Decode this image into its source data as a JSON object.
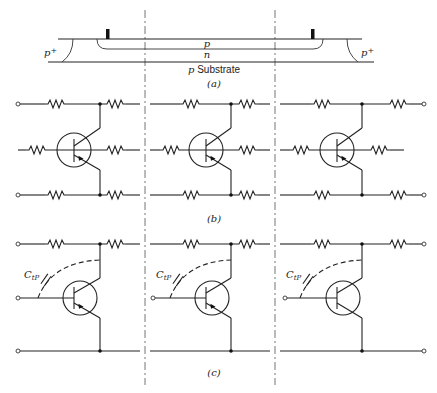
{
  "figure": {
    "panels": [
      {
        "id": "a",
        "caption": "(a)",
        "labels": {
          "left_isolation": "p",
          "left_isolation_sup": "+",
          "right_isolation": "p",
          "right_isolation_sup": "+",
          "p_layer": "p",
          "n_layer": "n",
          "substrate_italic": "p",
          "substrate_text": " Substrate"
        },
        "description": "Cross-section of distributed transistor structure: p layer over n layer on p substrate with p+ isolation at both ends and two contacts"
      },
      {
        "id": "b",
        "caption": "(b)",
        "description": "Distributed RC ladder model with three transistor sections; each section has resistors on top, middle (base) and bottom rows"
      },
      {
        "id": "c",
        "caption": "(c)",
        "capacitor_label": "C",
        "capacitor_subscript": "tP",
        "description": "Three transistor sections each with a dashed parasitic capacitance C_tP from base to collector node"
      }
    ],
    "section_dividers": 2,
    "sections_per_panel": 3
  }
}
